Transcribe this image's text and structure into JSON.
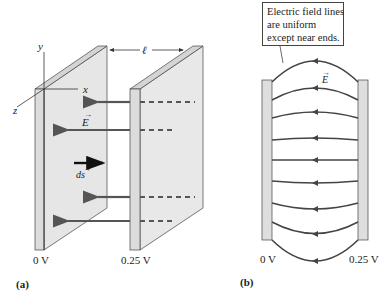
{
  "panel_a": {
    "label": "(a)",
    "axes": {
      "x": "x",
      "y": "y",
      "z": "z"
    },
    "separation_label": "ℓ",
    "field_label": "E",
    "displacement_label": "ds",
    "left_plate_voltage": "0 V",
    "right_plate_voltage": "0.25 V"
  },
  "panel_b": {
    "label": "(b)",
    "callout": {
      "line1": "Electric field lines",
      "line2": "are uniform",
      "line3": "except near ends."
    },
    "field_label": "E",
    "left_plate_voltage": "0 V",
    "right_plate_voltage": "0.25 V"
  },
  "colors": {
    "plate_face": "#e6e6e6",
    "plate_edge": "#d0d0d0",
    "field_line": "#555555",
    "outline": "#333333"
  }
}
